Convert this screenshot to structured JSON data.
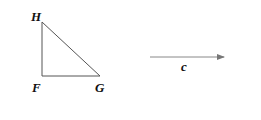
{
  "diagram": {
    "triangle": {
      "vertices": {
        "H": {
          "label": "H"
        },
        "F": {
          "label": "F"
        },
        "G": {
          "label": "G"
        }
      },
      "right_angle_at": "F"
    },
    "vector": {
      "label": "c",
      "direction": "right"
    },
    "colors": {
      "line": "#555555",
      "text": "#111111",
      "background": "#ffffff"
    }
  }
}
